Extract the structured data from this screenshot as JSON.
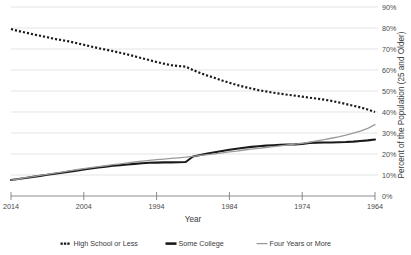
{
  "chart_data": {
    "type": "line",
    "title": "",
    "xlabel": "Year",
    "ylabel": "Percent of the Population (25 and Older)",
    "xlim": [
      2014,
      1964
    ],
    "ylim": [
      0,
      90
    ],
    "x_tick_labels": [
      "2014",
      "2004",
      "1994",
      "1984",
      "1974",
      "1964"
    ],
    "x_ticks": [
      2014,
      2004,
      1994,
      1984,
      1974,
      1964
    ],
    "y_tick_labels": [
      "0%",
      "10%",
      "20%",
      "30%",
      "40%",
      "50%",
      "60%",
      "70%",
      "80%",
      "90%"
    ],
    "y_ticks": [
      0,
      10,
      20,
      30,
      40,
      50,
      60,
      70,
      80,
      90
    ],
    "grid": true,
    "x_axis_reversed": true,
    "y_axis_position": "right",
    "legend_position": "bottom",
    "x": [
      2014,
      2013,
      2012,
      2011,
      2010,
      2009,
      2008,
      2007,
      2006,
      2005,
      2004,
      2003,
      2002,
      2001,
      2000,
      1999,
      1998,
      1997,
      1996,
      1995,
      1994,
      1993,
      1992,
      1991,
      1990,
      1989,
      1988,
      1987,
      1986,
      1985,
      1984,
      1983,
      1982,
      1981,
      1980,
      1979,
      1978,
      1977,
      1976,
      1975,
      1974,
      1973,
      1972,
      1971,
      1970,
      1969,
      1968,
      1967,
      1966,
      1965,
      1964
    ],
    "series": [
      {
        "name": "High School or Less",
        "style": "dotted",
        "color": "#1a1a1a",
        "values": [
          79.5,
          78.6,
          77.8,
          77.0,
          76.3,
          75.6,
          74.8,
          74.2,
          73.6,
          72.8,
          72.0,
          71.2,
          70.4,
          69.7,
          69.0,
          68.2,
          67.4,
          66.5,
          65.6,
          64.7,
          63.8,
          63.0,
          62.3,
          61.9,
          61.6,
          60.0,
          58.6,
          57.3,
          56.2,
          55.0,
          53.9,
          52.9,
          52.0,
          51.2,
          50.4,
          49.8,
          49.2,
          48.7,
          48.2,
          47.8,
          47.3,
          46.8,
          46.4,
          45.9,
          45.3,
          44.6,
          43.8,
          43.0,
          42.2,
          41.2,
          40.0
        ]
      },
      {
        "name": "Some College",
        "style": "solid-thick",
        "color": "#1a1a1a",
        "values": [
          7.6,
          8.1,
          8.6,
          9.1,
          9.6,
          10.1,
          10.6,
          11.1,
          11.6,
          12.1,
          12.6,
          13.1,
          13.6,
          14.0,
          14.4,
          14.7,
          15.0,
          15.3,
          15.6,
          15.8,
          15.9,
          16.0,
          16.0,
          16.1,
          16.2,
          18.8,
          19.5,
          20.2,
          20.8,
          21.4,
          22.0,
          22.5,
          23.0,
          23.4,
          23.7,
          24.0,
          24.2,
          24.4,
          24.5,
          24.6,
          24.8,
          25.3,
          25.4,
          25.5,
          25.5,
          25.6,
          25.7,
          25.9,
          26.2,
          26.5,
          26.9
        ]
      },
      {
        "name": "Four Years or More",
        "style": "solid-thin",
        "color": "#9a9a9a",
        "values": [
          7.6,
          8.1,
          8.7,
          9.2,
          9.8,
          10.3,
          10.9,
          11.4,
          12.0,
          12.5,
          13.0,
          13.5,
          14.0,
          14.4,
          14.9,
          15.3,
          15.8,
          16.2,
          16.6,
          17.0,
          17.3,
          17.6,
          17.9,
          18.2,
          18.5,
          18.9,
          19.3,
          19.7,
          20.1,
          20.5,
          21.0,
          21.4,
          21.9,
          22.3,
          22.7,
          23.1,
          23.5,
          23.9,
          24.3,
          24.7,
          25.1,
          25.6,
          26.2,
          26.8,
          27.5,
          28.2,
          29.0,
          29.9,
          30.9,
          32.2,
          34.0
        ]
      }
    ],
    "legend": [
      {
        "label": "High School or Less",
        "marker": "dotted",
        "color": "#1a1a1a"
      },
      {
        "label": "Some College",
        "marker": "solid-thick",
        "color": "#1a1a1a"
      },
      {
        "label": "Four Years or More",
        "marker": "solid-thin",
        "color": "#9a9a9a"
      }
    ]
  }
}
